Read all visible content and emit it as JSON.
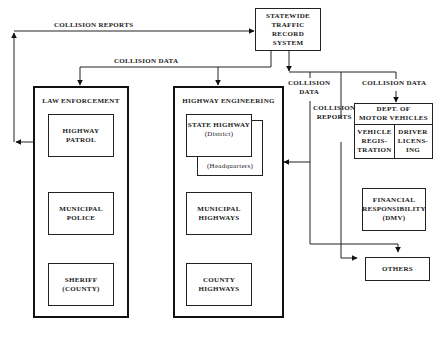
{
  "diagram": {
    "type": "flow",
    "nodes": {
      "statewide": {
        "lines": [
          "STATEWIDE",
          "TRAFFIC",
          "RECORD",
          "SYSTEM"
        ]
      },
      "law_enforcement": {
        "title": "LAW ENFORCEMENT",
        "children": [
          {
            "lines": [
              "HIGHWAY",
              "PATROL"
            ]
          },
          {
            "lines": [
              "MUNICIPAL",
              "POLICE"
            ]
          },
          {
            "lines": [
              "SHERIFF",
              "(COUNTY)"
            ]
          }
        ]
      },
      "highway_engineering": {
        "title": "HIGHWAY ENGINEERING",
        "children": [
          {
            "lines": [
              "STATE HIGHWAY",
              "(District)"
            ],
            "back_label": "(Headquarters)"
          },
          {
            "lines": [
              "MUNICIPAL",
              "HIGHWAYS"
            ]
          },
          {
            "lines": [
              "COUNTY",
              "HIGHWAYS"
            ]
          }
        ]
      },
      "dmv": {
        "title_lines": [
          "DEPT. OF",
          "MOTOR VEHICLES"
        ],
        "cells": [
          {
            "lines": [
              "VEHICLE",
              "REGIS-",
              "TRATION"
            ]
          },
          {
            "lines": [
              "DRIVER",
              "LICENS-",
              "ING"
            ]
          }
        ]
      },
      "financial": {
        "lines": [
          "FINANCIAL",
          "RESPONSIBILITY",
          "(DMV)"
        ]
      },
      "others": {
        "lines": [
          "OTHERS"
        ]
      }
    },
    "edge_labels": {
      "collision_reports_top": "COLLISION REPORTS",
      "collision_data_left": "COLLISION DATA",
      "collision_data_mid": [
        "COLLISION",
        "DATA"
      ],
      "collision_reports_mid": [
        "COLLISION",
        "REPORTS"
      ],
      "collision_data_dmv": "COLLISION DATA"
    },
    "edges": [
      {
        "from": "law_enforcement",
        "to": "statewide",
        "label": "COLLISION REPORTS"
      },
      {
        "from": "statewide",
        "to": "law_enforcement",
        "label": "COLLISION DATA"
      },
      {
        "from": "statewide",
        "to": "highway_engineering",
        "label": "COLLISION DATA"
      },
      {
        "from": "statewide",
        "to": "state_highway_headquarters",
        "label": "COLLISION DATA"
      },
      {
        "from": "statewide",
        "to": "financial",
        "label": "COLLISION REPORTS"
      },
      {
        "from": "statewide",
        "to": "dmv",
        "label": "COLLISION DATA"
      },
      {
        "from": "statewide",
        "to": "others"
      }
    ]
  }
}
